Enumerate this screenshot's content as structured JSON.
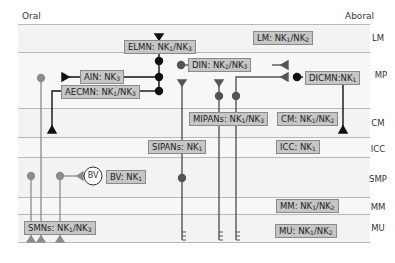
{
  "header": {
    "oral": "Oral",
    "aboral": "Aboral"
  },
  "layers": [
    {
      "id": "LM",
      "label": "LM",
      "top": 24,
      "bottom": 52
    },
    {
      "id": "MP",
      "label": "MP",
      "top": 52,
      "bottom": 108
    },
    {
      "id": "CM",
      "label": "CM",
      "top": 108,
      "bottom": 137
    },
    {
      "id": "ICC",
      "label": "ICC",
      "top": 137,
      "bottom": 157
    },
    {
      "id": "SMP",
      "label": "SMP",
      "top": 157,
      "bottom": 197
    },
    {
      "id": "MM",
      "label": "MM",
      "top": 197,
      "bottom": 214
    },
    {
      "id": "MU",
      "label": "MU",
      "top": 214,
      "bottom": 242
    }
  ],
  "boxes": {
    "elmn": {
      "name": "ELMN",
      "receptors": [
        "NK",
        "1",
        "/NK",
        "3"
      ]
    },
    "lm": {
      "name": "LM",
      "receptors": [
        "NK",
        "1",
        "/NK",
        "2"
      ]
    },
    "ain": {
      "name": "AIN",
      "receptors": [
        "NK",
        "3"
      ]
    },
    "din": {
      "name": "DIN",
      "receptors": [
        "NK",
        "2",
        "/NK",
        "3"
      ]
    },
    "dicmn": {
      "name": "DICMN",
      "receptors": [
        "NK",
        "1"
      ]
    },
    "aecmn": {
      "name": "AECMN",
      "receptors": [
        "NK",
        "1",
        "/NK",
        "3"
      ]
    },
    "mipans": {
      "name": "MIPANs",
      "receptors": [
        "NK",
        "1",
        "/NK",
        "3"
      ]
    },
    "cm": {
      "name": "CM",
      "receptors": [
        "NK",
        "1",
        "/NK",
        "2"
      ]
    },
    "sipans": {
      "name": "SIPANs",
      "receptors": [
        "NK",
        "1"
      ]
    },
    "icc": {
      "name": "ICC",
      "receptors": [
        "NK",
        "1"
      ]
    },
    "bv": {
      "name": "BV",
      "receptors": [
        "NK",
        "1"
      ]
    },
    "mm": {
      "name": "MM",
      "receptors": [
        "NK",
        "1",
        "/NK",
        "2"
      ]
    },
    "mu": {
      "name": "MU",
      "receptors": [
        "NK",
        "1",
        "/NK",
        "2"
      ]
    },
    "smns": {
      "name": "SMNs",
      "receptors": [
        "NK",
        "1",
        "/NK",
        "3"
      ]
    }
  },
  "bv_circle_label": "BV",
  "colors": {
    "box_fill": "#c6c6c6",
    "box_border": "#8a8a8a",
    "wire_black": "#111111",
    "wire_dark_gray": "#555555",
    "wire_gray": "#8c8c8c"
  }
}
